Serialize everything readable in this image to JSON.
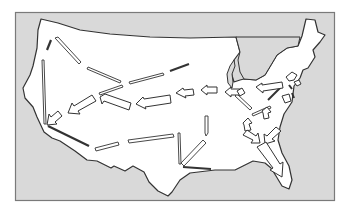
{
  "figure": {
    "colors": {
      "page_background": "#ffffff",
      "frame_fill": "#d9d9d9",
      "frame_stroke": "#7a7a7a",
      "land_fill": "#ffffff",
      "land_stroke": "#333333",
      "arrow_fill": "#ffffff",
      "arrow_stroke": "#333333",
      "bar_dark": "#333333"
    }
  },
  "arrows": {
    "block_arrows": [
      {
        "id": "ne-to-ohio",
        "direction": "west"
      },
      {
        "id": "midwest-west-1",
        "direction": "west"
      },
      {
        "id": "midwest-west-2",
        "direction": "west"
      },
      {
        "id": "plains-west",
        "direction": "west"
      },
      {
        "id": "mountain-sw",
        "direction": "southwest"
      },
      {
        "id": "west-coast-sw",
        "direction": "southwest"
      },
      {
        "id": "southeast-south-1",
        "direction": "southeast"
      },
      {
        "id": "southeast-south-2",
        "direction": "southwest"
      },
      {
        "id": "florida",
        "direction": "south"
      }
    ],
    "line_arrows_count": 14
  }
}
